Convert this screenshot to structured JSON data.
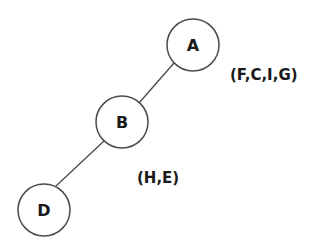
{
  "diagram": {
    "type": "tree",
    "nodes": [
      {
        "id": "A",
        "label": "A",
        "cx": 193,
        "cy": 45,
        "r": 26
      },
      {
        "id": "B",
        "label": "B",
        "cx": 122,
        "cy": 122,
        "r": 26
      },
      {
        "id": "D",
        "label": "D",
        "cx": 44,
        "cy": 210,
        "r": 26
      }
    ],
    "edges": [
      {
        "from": "A",
        "to": "B"
      },
      {
        "from": "B",
        "to": "D"
      }
    ],
    "annotations": [
      {
        "near": "A",
        "text": "(F,C,I,G)"
      },
      {
        "near": "B",
        "text": "(H,E)"
      }
    ],
    "colors": {
      "stroke": "#4a4a4a",
      "text": "#1a1a1a",
      "background": "#ffffff"
    }
  }
}
